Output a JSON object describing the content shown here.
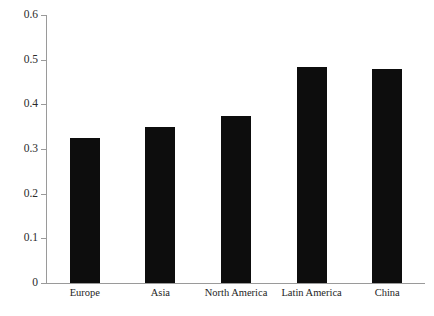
{
  "chart_data": {
    "type": "bar",
    "title": "",
    "subtitle": "",
    "xlabel": "",
    "ylabel": "",
    "categories": [
      "Europe",
      "Asia",
      "North America",
      "Latin America",
      "China"
    ],
    "values": [
      0.325,
      0.35,
      0.373,
      0.483,
      0.478
    ],
    "series": [
      {
        "name": "",
        "values": [
          0.325,
          0.35,
          0.373,
          0.483,
          0.478
        ]
      }
    ],
    "ylim": [
      0,
      0.6
    ],
    "yticks": [
      0,
      0.1,
      0.2,
      0.3,
      0.4,
      0.5,
      0.6
    ],
    "ytick_labels": [
      "0",
      "0.1",
      "0.2",
      "0.3",
      "0.4",
      "0.5",
      "0.6"
    ],
    "grid": false,
    "legend": false,
    "legend_position": "none",
    "bar_color": "#0d0d0d",
    "axis_color": "#9a9a9a",
    "background_color": "#ffffff"
  },
  "axis": {
    "ticks": [
      {
        "label": "0.6",
        "value": 0.6
      },
      {
        "label": "0.5",
        "value": 0.5
      },
      {
        "label": "0.4",
        "value": 0.4
      },
      {
        "label": "0.3",
        "value": 0.3
      },
      {
        "label": "0.2",
        "value": 0.2
      },
      {
        "label": "0.1",
        "value": 0.1
      },
      {
        "label": "0",
        "value": 0
      }
    ]
  }
}
